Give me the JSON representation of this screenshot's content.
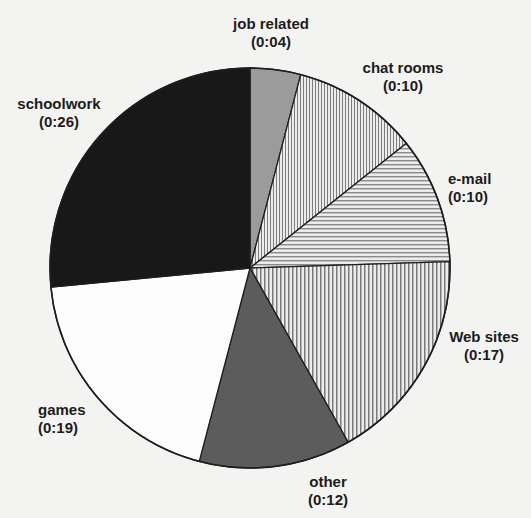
{
  "chart_data": {
    "type": "pie",
    "title": "",
    "unit": "hours:minutes",
    "start_angle_deg": 0,
    "direction": "clockwise",
    "slices": [
      {
        "label": "job related",
        "value_text": "(0:04)",
        "minutes": 4,
        "fill": "#9b9b9b",
        "pattern": "solid"
      },
      {
        "label": "chat rooms",
        "value_text": "(0:10)",
        "minutes": 10,
        "fill": "#e6e6e6",
        "pattern": "vertical-stripes-fine"
      },
      {
        "label": "e-mail",
        "value_text": "(0:10)",
        "minutes": 10,
        "fill": "#e6e6e6",
        "pattern": "horizontal-stripes"
      },
      {
        "label": "Web sites",
        "value_text": "(0:17)",
        "minutes": 17,
        "fill": "#e6e6e6",
        "pattern": "vertical-stripes"
      },
      {
        "label": "other",
        "value_text": "(0:12)",
        "minutes": 12,
        "fill": "#5c5c5c",
        "pattern": "solid"
      },
      {
        "label": "games",
        "value_text": "(0:19)",
        "minutes": 19,
        "fill": "#fdfdfd",
        "pattern": "solid"
      },
      {
        "label": "schoolwork",
        "value_text": "(0:26)",
        "minutes": 26,
        "fill": "#181818",
        "pattern": "solid"
      }
    ],
    "categories": [
      "job related",
      "chat rooms",
      "e-mail",
      "Web sites",
      "other",
      "games",
      "schoolwork"
    ],
    "values": [
      4,
      10,
      10,
      17,
      12,
      19,
      26
    ],
    "legend": "none (direct labels)"
  },
  "labels": {
    "job_related": {
      "name": "job related",
      "value": "(0:04)"
    },
    "chat_rooms": {
      "name": "chat rooms",
      "value": "(0:10)"
    },
    "email": {
      "name": "e-mail",
      "value": "(0:10)"
    },
    "web_sites": {
      "name": "Web sites",
      "value": "(0:17)"
    },
    "other": {
      "name": "other",
      "value": "(0:12)"
    },
    "games": {
      "name": "games",
      "value": "(0:19)"
    },
    "schoolwork": {
      "name": "schoolwork",
      "value": "(0:26)"
    }
  },
  "colors": {
    "background": "#f3f3f1",
    "outline": "#1e1e1e",
    "stripe": "#7a7a7a"
  }
}
